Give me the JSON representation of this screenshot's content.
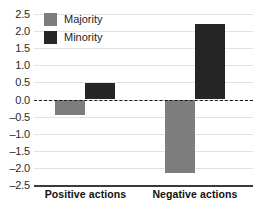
{
  "chart_data": {
    "type": "bar",
    "title": "",
    "subtitle": "",
    "xlabel": "",
    "ylabel": "",
    "categories": [
      "Positive actions",
      "Negative actions"
    ],
    "series": [
      {
        "name": "Majority",
        "color": "#7d7d7d",
        "values": [
          -0.45,
          -2.15
        ]
      },
      {
        "name": "Minority",
        "color": "#262626",
        "values": [
          0.47,
          2.22
        ]
      }
    ],
    "ylim": [
      -2.5,
      2.5
    ],
    "ytick_labels": [
      "2.5",
      "2.0",
      "1.5",
      "1.0",
      "0.5",
      "0.0",
      "–0.5",
      "–1.0",
      "–1.5",
      "–2.0",
      "–2.5"
    ],
    "ytick_values": [
      2.5,
      2.0,
      1.5,
      1.0,
      0.5,
      0.0,
      -0.5,
      -1.0,
      -1.5,
      -2.0,
      -2.5
    ],
    "grid": true,
    "zero_line": {
      "value": 0.0,
      "style": "dashed",
      "color": "#1a1a1a"
    },
    "legend": {
      "position": "top-left",
      "entries": [
        {
          "label": "Majority",
          "color": "#7d7d7d"
        },
        {
          "label": "Minority",
          "color": "#262626"
        }
      ]
    }
  }
}
